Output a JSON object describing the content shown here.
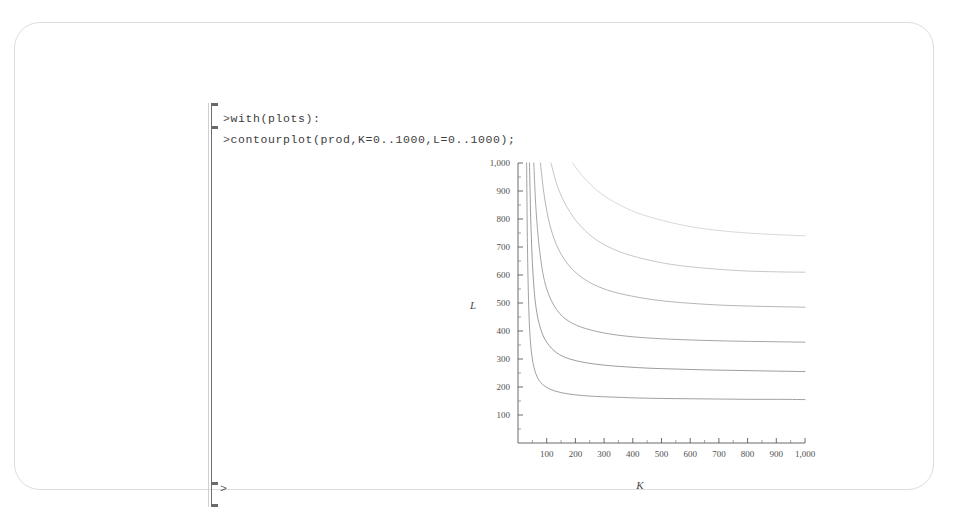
{
  "document": {
    "app": "Maple Worksheet",
    "frame_border_color": "#dcdcdc",
    "background_color": "#ffffff"
  },
  "worksheet": {
    "bracket_name": "execution-group-bracket",
    "prompt_symbol": ">",
    "lines": [
      {
        "prompt": ">",
        "code": "with(plots):"
      },
      {
        "prompt": ">",
        "code": "contourplot(prod,K=0..1000,L=0..1000);"
      },
      {
        "prompt": ">",
        "code": ""
      }
    ]
  },
  "chart_data": {
    "type": "line",
    "title": "",
    "subtitle": "",
    "xlabel": "K",
    "ylabel": "L",
    "xlim": [
      0,
      1000
    ],
    "ylim": [
      0,
      1000
    ],
    "xticks": [
      100,
      200,
      300,
      400,
      500,
      600,
      700,
      800,
      900,
      1000
    ],
    "xticklabels": [
      "100",
      "200",
      "300",
      "400",
      "500",
      "600",
      "700",
      "800",
      "900",
      "1,000"
    ],
    "yticks": [
      100,
      200,
      300,
      400,
      500,
      600,
      700,
      800,
      900,
      1000
    ],
    "yticklabels": [
      "100",
      "200",
      "300",
      "400",
      "500",
      "600",
      "700",
      "800",
      "900",
      "1,000"
    ],
    "minor_tick_step": 50,
    "grid": false,
    "legend": "none",
    "axes_style": "boxed-left-bottom",
    "series": [
      {
        "name": "contour-1",
        "color": "#909090",
        "right_end_L": 155,
        "points_x": [
          30,
          33,
          37,
          42,
          50,
          62,
          80,
          110,
          150,
          200,
          260,
          330,
          410,
          500,
          600,
          700,
          800,
          900,
          1000
        ],
        "points_y": [
          1000,
          700,
          500,
          380,
          300,
          248,
          215,
          193,
          180,
          172,
          167,
          164,
          161,
          159,
          158,
          157,
          156,
          156,
          155
        ]
      },
      {
        "name": "contour-2",
        "color": "#8a8a8a",
        "right_end_L": 255,
        "points_x": [
          40,
          45,
          52,
          62,
          78,
          100,
          135,
          180,
          235,
          300,
          375,
          460,
          555,
          660,
          770,
          885,
          1000
        ],
        "points_y": [
          1000,
          780,
          610,
          490,
          410,
          360,
          322,
          300,
          287,
          278,
          272,
          267,
          264,
          261,
          259,
          257,
          255
        ]
      },
      {
        "name": "contour-3",
        "color": "#959595",
        "right_end_L": 360,
        "points_x": [
          55,
          63,
          75,
          92,
          118,
          155,
          205,
          268,
          342,
          428,
          525,
          630,
          745,
          870,
          1000
        ],
        "points_y": [
          1000,
          830,
          690,
          580,
          505,
          452,
          420,
          400,
          386,
          377,
          371,
          367,
          364,
          362,
          360
        ]
      },
      {
        "name": "contour-4",
        "color": "#a8a8a8",
        "right_end_L": 485,
        "points_x": [
          78,
          92,
          112,
          142,
          185,
          242,
          312,
          395,
          492,
          600,
          718,
          848,
          1000
        ],
        "points_y": [
          1000,
          880,
          775,
          690,
          625,
          578,
          546,
          525,
          509,
          499,
          492,
          488,
          485
        ]
      },
      {
        "name": "contour-5",
        "color": "#bdbdbd",
        "right_end_L": 610,
        "points_x": [
          115,
          138,
          172,
          218,
          278,
          352,
          440,
          540,
          655,
          780,
          915,
          1000
        ],
        "points_y": [
          1000,
          915,
          840,
          775,
          722,
          684,
          657,
          637,
          624,
          615,
          611,
          610
        ]
      },
      {
        "name": "contour-6",
        "color": "#d2d2d2",
        "right_end_L": 740,
        "points_x": [
          190,
          228,
          278,
          340,
          415,
          503,
          605,
          718,
          845,
          1000
        ],
        "points_y": [
          1000,
          950,
          900,
          858,
          822,
          795,
          772,
          757,
          747,
          740
        ]
      }
    ]
  }
}
